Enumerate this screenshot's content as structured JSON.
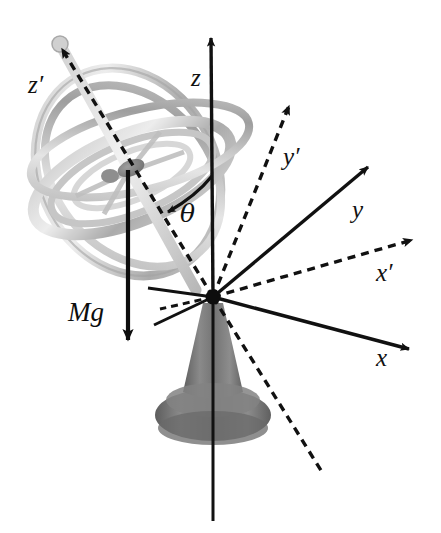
{
  "figure": {
    "background_color": "#ffffff",
    "width": 441,
    "height": 533
  },
  "labels": {
    "z_prime": "z′",
    "z": "z",
    "y_prime": "y′",
    "y": "y",
    "x_prime": "x′",
    "x": "x",
    "theta": "θ",
    "mg": "Mg"
  },
  "colors": {
    "ink": "#111111",
    "line": "#1a1a1a",
    "base_dark": "#6e6e6e",
    "base_mid": "#7d7d7d",
    "base_light": "#969696",
    "ring_light": "#d9d9d9",
    "ring_mid": "#b5b5b5",
    "ring_dark": "#8e8e8e",
    "hub": "#777777",
    "background": "#ffffff"
  },
  "geometry": {
    "origin": {
      "x": 213,
      "y": 297
    },
    "gyro_center": {
      "x": 128,
      "y": 172
    },
    "axes": [
      {
        "name": "z",
        "style": "solid",
        "label": "z",
        "tip": {
          "x": 211,
          "y": 33
        },
        "label_pos": {
          "x": 191,
          "y": 86
        }
      },
      {
        "name": "z-prime",
        "style": "dashed",
        "label": "z′",
        "tip": {
          "x": 55,
          "y": 41
        },
        "label_pos": {
          "x": 28,
          "y": 93
        }
      },
      {
        "name": "y-prime",
        "style": "dashed",
        "label": "y′",
        "tip": {
          "x": 286,
          "y": 101
        },
        "label_pos": {
          "x": 285,
          "y": 163
        }
      },
      {
        "name": "y",
        "style": "solid",
        "label": "y",
        "tip": {
          "x": 372,
          "y": 162
        },
        "label_pos": {
          "x": 354,
          "y": 216
        }
      },
      {
        "name": "x-prime",
        "style": "dashed",
        "label": "x′",
        "tip": {
          "x": 414,
          "y": 237
        },
        "label_pos": {
          "x": 379,
          "y": 279
        }
      },
      {
        "name": "x",
        "style": "solid",
        "label": "x",
        "tip": {
          "x": 414,
          "y": 352
        },
        "label_pos": {
          "x": 378,
          "y": 364
        }
      }
    ],
    "weight_vector": {
      "from": {
        "x": 128,
        "y": 172
      },
      "to": {
        "x": 128,
        "y": 352
      },
      "label_pos": {
        "x": 72,
        "y": 320
      }
    },
    "angle_arc": {
      "label": "θ",
      "label_pos": {
        "x": 183,
        "y": 217
      },
      "from_axis": "z",
      "to_axis": "z-prime"
    }
  }
}
